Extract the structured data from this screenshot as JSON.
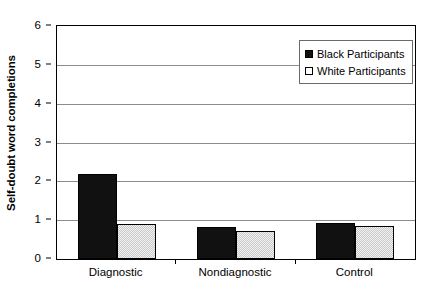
{
  "chart_data": {
    "type": "bar",
    "title": "",
    "xlabel": "",
    "ylabel": "Self-doubt word completions",
    "categories": [
      "Diagnostic",
      "Nondiagnostic",
      "Control"
    ],
    "series": [
      {
        "name": "Black Participants",
        "color": "#111111",
        "values": [
          2.2,
          0.83,
          0.92
        ]
      },
      {
        "name": "White Participants",
        "color": "#c9c9c9",
        "values": [
          0.9,
          0.72,
          0.86
        ]
      }
    ],
    "ylim": [
      0,
      6
    ],
    "yticks": [
      0,
      1,
      2,
      3,
      4,
      5,
      6
    ],
    "ytick_labels": [
      "0",
      "1",
      "2",
      "3",
      "4",
      "5",
      "6"
    ],
    "grid": true,
    "legend_position": "top-right",
    "legend_entries": [
      {
        "label": "Black Participants",
        "swatch": "filled-black-square"
      },
      {
        "label": "White Participants",
        "swatch": "open-white-square"
      }
    ]
  }
}
